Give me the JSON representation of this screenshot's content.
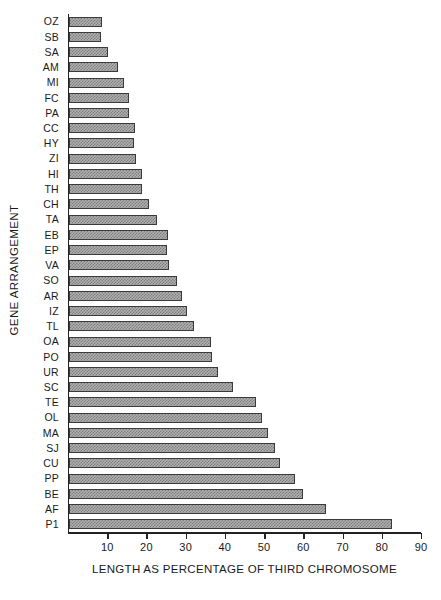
{
  "chart_data": {
    "type": "bar",
    "orientation": "horizontal",
    "title": "",
    "xlabel": "LENGTH AS PERCENTAGE OF THIRD CHROMOSOME",
    "ylabel": "GENE ARRANGEMENT",
    "xlim": [
      0,
      90
    ],
    "ylim": null,
    "grid": false,
    "legend": null,
    "xticks": [
      10,
      20,
      30,
      40,
      50,
      60,
      70,
      80,
      90
    ],
    "xticklabels": [
      "10",
      "20",
      "30",
      "40",
      "50",
      "60",
      "70",
      "80",
      "90"
    ],
    "categories": [
      "OZ",
      "SB",
      "SA",
      "AM",
      "MI",
      "FC",
      "PA",
      "CC",
      "HY",
      "ZI",
      "HI",
      "TH",
      "CH",
      "TA",
      "EB",
      "EP",
      "VA",
      "SO",
      "AR",
      "IZ",
      "TL",
      "OA",
      "PO",
      "UR",
      "SC",
      "TE",
      "OL",
      "MA",
      "SJ",
      "CU",
      "PP",
      "BE",
      "AF",
      "P1"
    ],
    "values": [
      8.5,
      8.2,
      9.9,
      12.5,
      13.9,
      15.2,
      15.2,
      16.7,
      16.5,
      17.1,
      18.6,
      18.5,
      20.5,
      22.5,
      25.2,
      25.0,
      25.4,
      27.5,
      28.7,
      30.2,
      31.8,
      36.2,
      36.4,
      38.0,
      41.8,
      47.8,
      49.2,
      50.8,
      52.5,
      53.8,
      57.5,
      59.6,
      65.6,
      82.3
    ],
    "bar_fill": "#b0b0b0",
    "bar_pattern": "checkered-stipple",
    "bar_edge_color": "#3a3a3a",
    "axis_color": "#222222"
  }
}
